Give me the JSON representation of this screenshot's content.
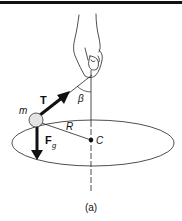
{
  "figure": {
    "caption": "(a)",
    "labels": {
      "mass": "m",
      "tension": "T",
      "angle": "β",
      "radius": "R",
      "center": "C",
      "gravity": "F",
      "gravity_sub": "g"
    },
    "colors": {
      "ink": "#111111",
      "ball_fill": "#e4e4e4",
      "background": "#ffffff"
    }
  }
}
